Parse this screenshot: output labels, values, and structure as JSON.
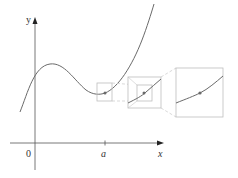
{
  "figure": {
    "axes": {
      "x_label": "x",
      "y_label": "y",
      "origin_label": "0",
      "tick_label": "a"
    },
    "colors": {
      "axis": "#555555",
      "curve": "#6a6a6a",
      "box": "#bdbdbd",
      "connector": "#c8c8c8",
      "point": "#6a6a6a",
      "text": "#333333"
    },
    "zoom_boxes": [
      {
        "name": "zoom-level-1",
        "x": 97,
        "y": 83,
        "w": 15,
        "h": 18
      },
      {
        "name": "zoom-level-2",
        "x": 128,
        "y": 77,
        "w": 33,
        "h": 31
      },
      {
        "name": "zoom-level-3",
        "x": 176,
        "y": 68,
        "w": 47,
        "h": 49
      }
    ]
  }
}
